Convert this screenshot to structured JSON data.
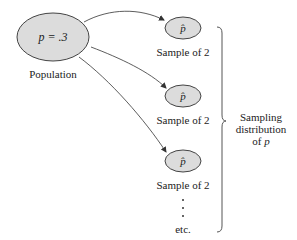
{
  "population": {
    "parameter_label": "p = .3",
    "caption": "Population"
  },
  "samples": [
    {
      "statistic_label": "p̂",
      "caption": "Sample of 2"
    },
    {
      "statistic_label": "p̂",
      "caption": "Sample of 2"
    },
    {
      "statistic_label": "p̂",
      "caption": "Sample of 2"
    }
  ],
  "continuation": {
    "dots": 3,
    "caption": "etc."
  },
  "brace_label": {
    "line1": "Sampling",
    "line2": "distribution",
    "line3_prefix": "of ",
    "line3_var": "p"
  },
  "colors": {
    "ellipse_fill": "#dcdcdc",
    "stroke": "#444444",
    "text": "#222222"
  }
}
